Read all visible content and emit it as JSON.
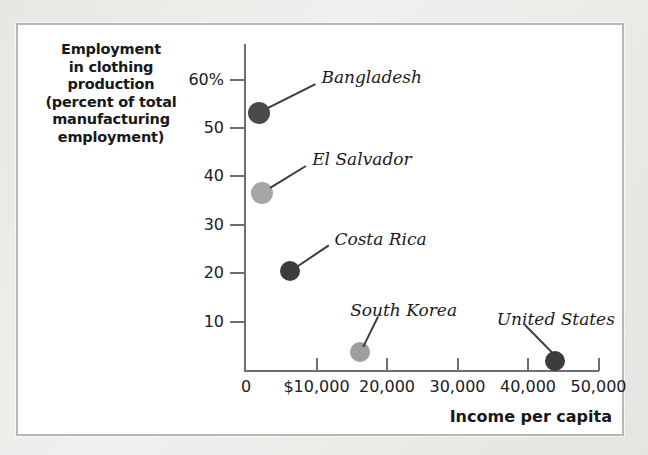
{
  "figure": {
    "y_axis_caption_lines": [
      "Employment",
      "in clothing",
      "production",
      "(percent of total",
      "manufacturing",
      "employment)"
    ],
    "x_axis_title": "Income per capita"
  },
  "chart_data": {
    "type": "scatter",
    "title": "",
    "xlabel": "Income per capita",
    "ylabel": "Employment in clothing production (percent of total manufacturing employment)",
    "xlim": [
      0,
      55000
    ],
    "ylim": [
      0,
      62
    ],
    "grid": false,
    "legend": "none",
    "x_ticks": [
      {
        "value": 0,
        "label": "0"
      },
      {
        "value": 10000,
        "label": "$10,000"
      },
      {
        "value": 20000,
        "label": "20,000"
      },
      {
        "value": 30000,
        "label": "30,000"
      },
      {
        "value": 40000,
        "label": "40,000"
      },
      {
        "value": 50000,
        "label": "50,000"
      }
    ],
    "y_ticks": [
      {
        "value": 10,
        "label": "10"
      },
      {
        "value": 20,
        "label": "20"
      },
      {
        "value": 30,
        "label": "30"
      },
      {
        "value": 40,
        "label": "40"
      },
      {
        "value": 50,
        "label": "50"
      },
      {
        "value": 60,
        "label": "60%"
      }
    ],
    "points": [
      {
        "name": "Bangladesh",
        "x": 1900,
        "y": 53.0,
        "color": "#4a4a4c",
        "radius": 11
      },
      {
        "name": "El Salvador",
        "x": 2300,
        "y": 36.6,
        "color": "#a6a6a6",
        "radius": 11
      },
      {
        "name": "Costa Rica",
        "x": 6300,
        "y": 20.5,
        "color": "#3c3c3e",
        "radius": 10
      },
      {
        "name": "South Korea",
        "x": 16200,
        "y": 3.8,
        "color": "#9d9d9d",
        "radius": 10
      },
      {
        "name": "United States",
        "x": 43800,
        "y": 1.9,
        "color": "#3c3c3e",
        "radius": 10
      }
    ],
    "annotations": [
      {
        "text": "Bangladesh",
        "for": "Bangladesh"
      },
      {
        "text": "El Salvador",
        "for": "El Salvador"
      },
      {
        "text": "Costa Rica",
        "for": "Costa Rica"
      },
      {
        "text": "South Korea",
        "for": "South Korea"
      },
      {
        "text": "United States",
        "for": "United States"
      }
    ]
  },
  "colors": {
    "panel_background": "#ffffff",
    "panel_border": "#b8b6b4",
    "axis": "#6e6e70",
    "text": "#1b1b1d",
    "dark_marker": "#3c3c3e",
    "light_marker": "#a6a6a6"
  }
}
